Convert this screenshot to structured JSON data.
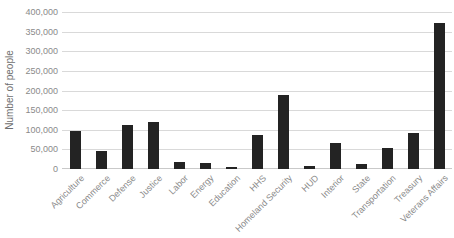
{
  "chart": {
    "background_color": "#ffffff",
    "bar_color": "#232323",
    "gridline_color": "#d9d9d9",
    "axis_line_color": "#c9c9c9",
    "tick_label_color": "#8a8a8a",
    "axis_title_color": "#6e6e6e"
  },
  "chart_data": {
    "type": "bar",
    "title": "",
    "xlabel": "",
    "ylabel": "Number of people",
    "ylim": [
      0,
      400000
    ],
    "ytick_interval": 50000,
    "grid": true,
    "legend": false,
    "categories": [
      "Agriculture",
      "Commerce",
      "Defense",
      "Justice",
      "Labor",
      "Energy",
      "Education",
      "HHS",
      "Homeland Security",
      "HUD",
      "Interior",
      "State",
      "Transportation",
      "Treasury",
      "Veterans Affairs"
    ],
    "values": [
      96000,
      47000,
      113000,
      119000,
      17000,
      15000,
      4000,
      87000,
      188000,
      8000,
      67000,
      12000,
      53000,
      92000,
      372000
    ]
  }
}
